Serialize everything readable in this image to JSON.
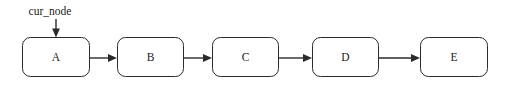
{
  "diagram": {
    "type": "linked-list",
    "canvas": {
      "width": 511,
      "height": 90,
      "background": "#ffffff"
    },
    "stroke_color": "#2b2b2b",
    "text_color": "#1a1a1a",
    "nodes": [
      {
        "id": "a",
        "label": "A",
        "x": 22,
        "y": 37,
        "width": 68,
        "height": 40,
        "radius": 8
      },
      {
        "id": "b",
        "label": "B",
        "x": 117,
        "y": 37,
        "width": 67,
        "height": 40,
        "radius": 8
      },
      {
        "id": "c",
        "label": "C",
        "x": 212,
        "y": 37,
        "width": 67,
        "height": 40,
        "radius": 8
      },
      {
        "id": "d",
        "label": "D",
        "x": 312,
        "y": 37,
        "width": 67,
        "height": 40,
        "radius": 8
      },
      {
        "id": "e",
        "label": "E",
        "x": 420,
        "y": 37,
        "width": 68,
        "height": 40,
        "radius": 8
      }
    ],
    "edges": [
      {
        "id": "a-b",
        "from": "A",
        "to": "B",
        "x1": 90,
        "y1": 58,
        "x2": 117,
        "y2": 58
      },
      {
        "id": "b-c",
        "from": "B",
        "to": "C",
        "x1": 184,
        "y1": 58,
        "x2": 212,
        "y2": 58
      },
      {
        "id": "c-d",
        "from": "C",
        "to": "D",
        "x1": 279,
        "y1": 58,
        "x2": 312,
        "y2": 58
      },
      {
        "id": "d-e",
        "from": "D",
        "to": "E",
        "x1": 379,
        "y1": 58,
        "x2": 420,
        "y2": 58
      }
    ],
    "annotations": [
      {
        "id": "cur-node",
        "label": "cur_node",
        "text_x": 50,
        "text_y": 15,
        "pointer_x": 56,
        "pointer_y1": 19,
        "pointer_y2": 37,
        "target": "A"
      }
    ]
  }
}
